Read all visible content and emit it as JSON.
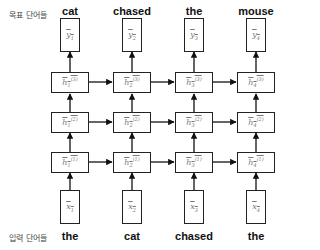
{
  "labels": {
    "target_words_label": "목표 단어들",
    "input_words_label": "입력 단어들"
  },
  "target_words": [
    "cat",
    "chased",
    "the",
    "mouse"
  ],
  "input_words": [
    "the",
    "cat",
    "chased",
    "the"
  ],
  "outputs": [
    {
      "sym": "y",
      "sub": "1"
    },
    {
      "sym": "y",
      "sub": "2"
    },
    {
      "sym": "y",
      "sub": "3"
    },
    {
      "sym": "y",
      "sub": "4"
    }
  ],
  "hidden_layers": [
    {
      "layer": "3",
      "cells": [
        {
          "sym": "h",
          "sub": "1",
          "sup": "(3)"
        },
        {
          "sym": "h",
          "sub": "2",
          "sup": "(3)"
        },
        {
          "sym": "h",
          "sub": "3",
          "sup": "(3)"
        },
        {
          "sym": "h",
          "sub": "4",
          "sup": "(3)"
        }
      ]
    },
    {
      "layer": "2",
      "cells": [
        {
          "sym": "h",
          "sub": "1",
          "sup": "(2)"
        },
        {
          "sym": "h",
          "sub": "2",
          "sup": "(2)"
        },
        {
          "sym": "h",
          "sub": "3",
          "sup": "(2)"
        },
        {
          "sym": "h",
          "sub": "4",
          "sup": "(2)"
        }
      ]
    },
    {
      "layer": "1",
      "cells": [
        {
          "sym": "h",
          "sub": "1",
          "sup": "(1)"
        },
        {
          "sym": "h",
          "sub": "2",
          "sup": "(1)"
        },
        {
          "sym": "h",
          "sub": "3",
          "sup": "(1)"
        },
        {
          "sym": "h",
          "sub": "4",
          "sup": "(1)"
        }
      ]
    }
  ],
  "inputs": [
    {
      "sym": "x",
      "sub": "1"
    },
    {
      "sym": "x",
      "sub": "2"
    },
    {
      "sym": "x",
      "sub": "3"
    },
    {
      "sym": "x",
      "sub": "4"
    }
  ]
}
